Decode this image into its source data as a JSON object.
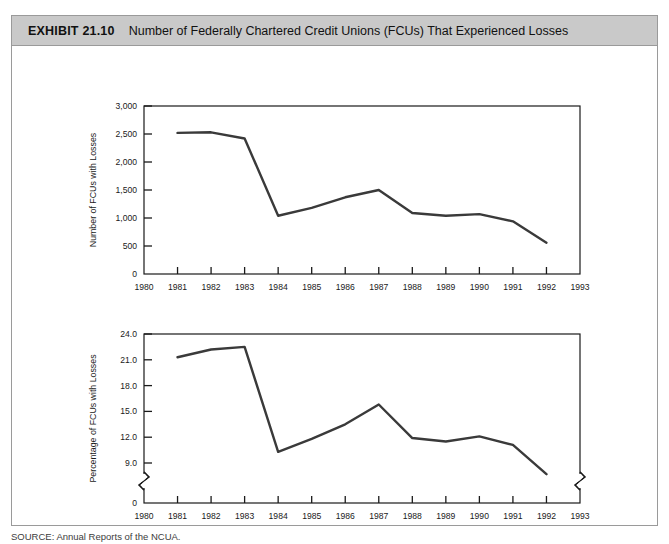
{
  "exhibit": {
    "number": "EXHIBIT 21.10",
    "title": "Number of Federally Chartered Credit Unions (FCUs) That Experienced Losses",
    "source_note": "SOURCE: Annual Reports of the NCUA."
  },
  "chart_data": [
    {
      "type": "line",
      "title": "",
      "xlabel": "",
      "ylabel": "Number of FCUs with Losses",
      "x": [
        1981,
        1982,
        1983,
        1984,
        1985,
        1986,
        1987,
        1988,
        1989,
        1990,
        1991,
        1992
      ],
      "values": [
        2520,
        2530,
        2420,
        1040,
        1180,
        1370,
        1500,
        1090,
        1040,
        1070,
        940,
        560
      ],
      "xlim": [
        1980,
        1993
      ],
      "ylim": [
        0,
        3000
      ],
      "xticks": [
        "1980",
        "1981",
        "1982",
        "1983",
        "1984",
        "1985",
        "1986",
        "1987",
        "1988",
        "1989",
        "1990",
        "1991",
        "1992",
        "1993"
      ],
      "yticks": [
        "0",
        "500",
        "1,000",
        "1,500",
        "2,000",
        "2,500",
        "3,000"
      ],
      "ytick_values": [
        0,
        500,
        1000,
        1500,
        2000,
        2500,
        3000
      ],
      "grid": false,
      "legend": "none",
      "axis_break": false,
      "line_color": "#3a3a3a"
    },
    {
      "type": "line",
      "title": "",
      "xlabel": "Year",
      "ylabel": "Percentage of FCUs with Losses",
      "x": [
        1981,
        1982,
        1983,
        1984,
        1985,
        1986,
        1987,
        1988,
        1989,
        1990,
        1991,
        1992
      ],
      "values": [
        21.3,
        22.2,
        22.5,
        10.3,
        11.8,
        13.5,
        15.8,
        11.9,
        11.5,
        12.1,
        11.1,
        7.7
      ],
      "xlim": [
        1980,
        1993
      ],
      "ylim": [
        7.5,
        24.0
      ],
      "xticks": [
        "1980",
        "1981",
        "1982",
        "1983",
        "1984",
        "1985",
        "1986",
        "1987",
        "1988",
        "1989",
        "1990",
        "1991",
        "1992",
        "1993"
      ],
      "yticks": [
        "0",
        "9.0",
        "12.0",
        "15.0",
        "18.0",
        "21.0",
        "24.0"
      ],
      "ytick_values": [
        0,
        9.0,
        12.0,
        15.0,
        18.0,
        21.0,
        24.0
      ],
      "grid": false,
      "legend": "none",
      "axis_break": true,
      "line_color": "#3a3a3a"
    }
  ]
}
